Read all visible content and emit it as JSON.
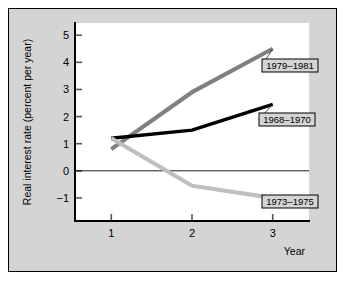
{
  "figure": {
    "background_color": "#d4d4d4",
    "plot_background_color": "#ffffff",
    "border_color": "#000000"
  },
  "chart_data": {
    "type": "line",
    "title": "",
    "xlabel": "Year",
    "ylabel": "Real interest rate  (percent per year)",
    "x": [
      1,
      2,
      3
    ],
    "xticklabels": [
      "1",
      "2",
      "3"
    ],
    "yticklabels": [
      "5",
      "4",
      "3",
      "2",
      "1",
      "0",
      "−1"
    ],
    "yticks": [
      5,
      4,
      3,
      2,
      1,
      0,
      -1
    ],
    "xlim": [
      0.55,
      3.45
    ],
    "ylim": [
      -1.85,
      5.45
    ],
    "grid": false,
    "legend": "inline-callouts",
    "series": [
      {
        "name": "1979–1981",
        "color": "#808080",
        "width": 4.2,
        "values": [
          0.8,
          2.9,
          4.5
        ]
      },
      {
        "name": "1968–1970",
        "color": "#000000",
        "width": 3.4,
        "values": [
          1.2,
          1.5,
          2.45
        ]
      },
      {
        "name": "1973–1975",
        "color": "#bfbfbf",
        "width": 4.2,
        "values": [
          1.2,
          -0.55,
          -1.0
        ]
      }
    ],
    "annotations": [
      {
        "label": "1979–1981",
        "series": 0,
        "box_x": 253,
        "box_y": 50
      },
      {
        "label": "1968–1970",
        "series": 1,
        "box_x": 250,
        "box_y": 104
      },
      {
        "label": "1973–1975",
        "series": 2,
        "box_x": 253,
        "box_y": 186
      }
    ]
  }
}
